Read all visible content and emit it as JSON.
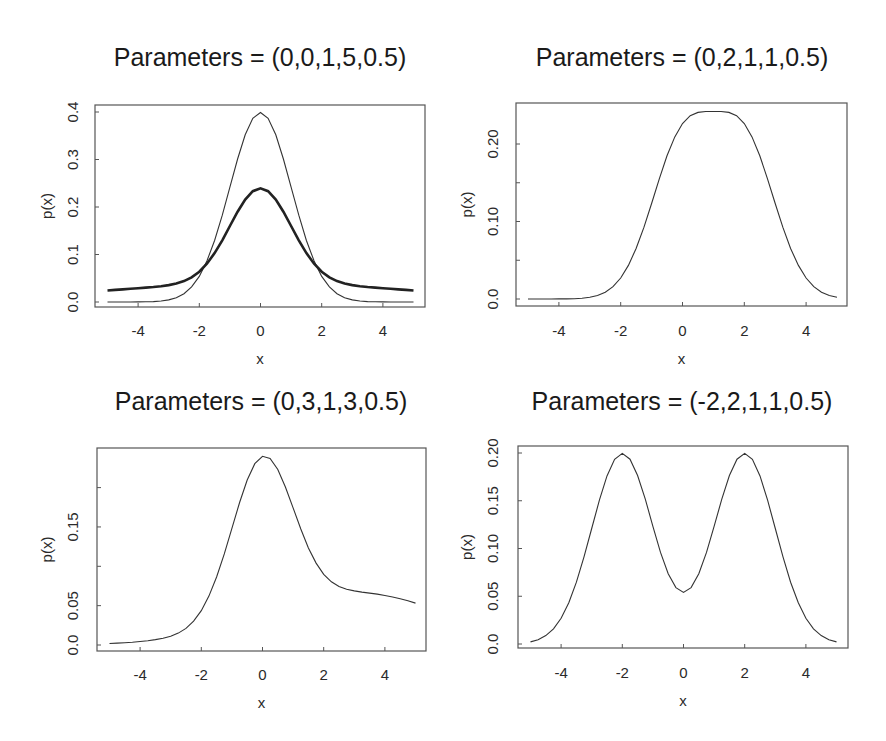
{
  "chart_data": [
    {
      "type": "line",
      "title": "Parameters = (0,0,1,5,0.5)",
      "xlabel": "x",
      "ylabel": "p(x)",
      "xlim": [
        -5,
        5
      ],
      "ylim": [
        0,
        0.4
      ],
      "x_ticks": [
        -4,
        -2,
        0,
        2,
        4
      ],
      "x_tick_labels": [
        "-4",
        "-2",
        "0",
        "2",
        "4"
      ],
      "y_ticks": [
        0.0,
        0.1,
        0.2,
        0.3,
        0.4
      ],
      "y_tick_labels": [
        "0.0",
        "0.1",
        "0.2",
        "0.3",
        "0.4"
      ],
      "grid": false,
      "legend": null,
      "frame": {
        "left": 95,
        "top": 105,
        "right": 425,
        "bottom": 307
      },
      "mapping": {
        "x0": 260.5,
        "xscale": 30.6,
        "y0": 302,
        "yscale": 475
      },
      "label_pos": {
        "title_x": 260,
        "title_y": 66,
        "xlabel_y": 364,
        "ylabel_x": 52,
        "ytick_x": 78,
        "xtick_y": 336
      },
      "x": [
        -5,
        -4.75,
        -4.5,
        -4.25,
        -4,
        -3.75,
        -3.5,
        -3.25,
        -3,
        -2.75,
        -2.5,
        -2.25,
        -2,
        -1.75,
        -1.5,
        -1.25,
        -1,
        -0.75,
        -0.5,
        -0.25,
        0,
        0.25,
        0.5,
        0.75,
        1,
        1.25,
        1.5,
        1.75,
        2,
        2.25,
        2.5,
        2.75,
        3,
        3.25,
        3.5,
        3.75,
        4,
        4.25,
        4.5,
        4.75,
        5
      ],
      "series": [
        {
          "name": "thin",
          "style": "thin",
          "values": [
            0.0,
            1e-05,
            2e-05,
            5e-05,
            0.00013,
            0.00035,
            0.00087,
            0.00203,
            0.00443,
            0.00909,
            0.01753,
            0.03174,
            0.05399,
            0.08628,
            0.12952,
            0.18265,
            0.24197,
            0.30114,
            0.35207,
            0.38667,
            0.39894,
            0.38667,
            0.35207,
            0.30114,
            0.24197,
            0.18265,
            0.12952,
            0.08628,
            0.05399,
            0.03174,
            0.01753,
            0.00909,
            0.00443,
            0.00203,
            0.00087,
            0.00035,
            0.00013,
            5e-05,
            2e-05,
            1e-05,
            0.0
          ]
        },
        {
          "name": "thick",
          "style": "thick",
          "values": [
            0.0242,
            0.02541,
            0.02662,
            0.02783,
            0.02904,
            0.03029,
            0.03166,
            0.03332,
            0.03554,
            0.03884,
            0.04398,
            0.05193,
            0.06383,
            0.08067,
            0.1029,
            0.13,
            0.16009,
            0.19002,
            0.21573,
            0.23318,
            0.23937,
            0.23318,
            0.21573,
            0.19002,
            0.16009,
            0.13,
            0.1029,
            0.08067,
            0.06383,
            0.05193,
            0.04398,
            0.03884,
            0.03554,
            0.03332,
            0.03166,
            0.03029,
            0.02904,
            0.02783,
            0.02662,
            0.02541,
            0.0242
          ]
        }
      ]
    },
    {
      "type": "line",
      "title": "Parameters = (0,2,1,1,0.5)",
      "xlabel": "x",
      "ylabel": "p(x)",
      "xlim": [
        -5,
        5
      ],
      "ylim": [
        0,
        0.25
      ],
      "x_ticks": [
        -4,
        -2,
        0,
        2,
        4
      ],
      "x_tick_labels": [
        "-4",
        "-2",
        "0",
        "2",
        "4"
      ],
      "y_ticks": [
        0.0,
        0.1,
        0.2
      ],
      "y_tick_labels": [
        "0.0",
        "0.10",
        "0.20"
      ],
      "y_minor_ticks": [
        0.05,
        0.15
      ],
      "grid": false,
      "legend": null,
      "frame": {
        "left": 516,
        "top": 103,
        "right": 847,
        "bottom": 306
      },
      "mapping": {
        "x0": 682.5,
        "xscale": 30.9,
        "y0": 299,
        "yscale": 775
      },
      "label_pos": {
        "title_x": 682,
        "title_y": 66,
        "xlabel_y": 364,
        "ylabel_x": 472,
        "ytick_x": 498,
        "xtick_y": 336
      },
      "x": [
        -5,
        -4.75,
        -4.5,
        -4.25,
        -4,
        -3.75,
        -3.5,
        -3.25,
        -3,
        -2.75,
        -2.5,
        -2.25,
        -2,
        -1.75,
        -1.5,
        -1.25,
        -1,
        -0.75,
        -0.5,
        -0.25,
        0,
        0.25,
        0.5,
        0.75,
        1,
        1.25,
        1.5,
        1.75,
        2,
        2.25,
        2.5,
        2.75,
        3,
        3.25,
        3.5,
        3.75,
        4,
        4.25,
        4.5,
        4.75,
        5
      ],
      "series": [
        {
          "name": "density",
          "style": "thin",
          "values": [
            0.0,
            0.0,
            1e-05,
            3e-05,
            7e-05,
            0.00018,
            0.00044,
            0.00102,
            0.00222,
            0.00455,
            0.00878,
            0.0159,
            0.02707,
            0.04331,
            0.0652,
            0.09235,
            0.12321,
            0.15512,
            0.18481,
            0.20921,
            0.22647,
            0.23648,
            0.2408,
            0.2419,
            0.24197,
            0.2419,
            0.2408,
            0.23648,
            0.22647,
            0.20921,
            0.18481,
            0.15512,
            0.12321,
            0.09235,
            0.0652,
            0.04331,
            0.02707,
            0.0159,
            0.00878,
            0.00455,
            0.00222
          ]
        }
      ]
    },
    {
      "type": "line",
      "title": "Parameters = (0,3,1,3,0.5)",
      "xlabel": "x",
      "ylabel": "p(x)",
      "xlim": [
        -5,
        5
      ],
      "ylim": [
        0,
        0.24
      ],
      "x_ticks": [
        -4,
        -2,
        0,
        2,
        4
      ],
      "x_tick_labels": [
        "-4",
        "-2",
        "0",
        "2",
        "4"
      ],
      "y_ticks": [
        0.0,
        0.05,
        0.15
      ],
      "y_tick_labels": [
        "0.0",
        "0.05",
        "0.15"
      ],
      "y_minor_ticks": [
        0.1,
        0.2
      ],
      "grid": false,
      "legend": null,
      "frame": {
        "left": 97,
        "top": 448,
        "right": 426,
        "bottom": 651
      },
      "mapping": {
        "x0": 262.5,
        "xscale": 30.6,
        "y0": 645,
        "yscale": 787
      },
      "label_pos": {
        "title_x": 261,
        "title_y": 410,
        "xlabel_y": 708,
        "ylabel_x": 52,
        "ytick_x": 78,
        "xtick_y": 680
      },
      "x": [
        -5,
        -4.75,
        -4.5,
        -4.25,
        -4,
        -3.75,
        -3.5,
        -3.25,
        -3,
        -2.75,
        -2.5,
        -2.25,
        -2,
        -1.75,
        -1.5,
        -1.25,
        -1,
        -0.75,
        -0.5,
        -0.25,
        0,
        0.25,
        0.5,
        0.75,
        1,
        1.25,
        1.5,
        1.75,
        2,
        2.25,
        2.5,
        2.75,
        3,
        3.25,
        3.5,
        3.75,
        4,
        4.25,
        4.5,
        4.75,
        5
      ],
      "series": [
        {
          "name": "density",
          "style": "thin",
          "values": [
            0.0019,
            0.00237,
            0.00293,
            0.00361,
            0.00444,
            0.00547,
            0.0068,
            0.00861,
            0.01122,
            0.01514,
            0.02115,
            0.03025,
            0.04358,
            0.06213,
            0.08635,
            0.11571,
            0.14832,
            0.18102,
            0.2097,
            0.23032,
            0.2398,
            0.23702,
            0.22302,
            0.20076,
            0.17423,
            0.14742,
            0.12344,
            0.1041,
            0.08989,
            0.08032,
            0.07434,
            0.07081,
            0.06871,
            0.06728,
            0.06601,
            0.06462,
            0.06296,
            0.06098,
            0.05869,
            0.0561,
            0.05324
          ]
        }
      ]
    },
    {
      "type": "line",
      "title": "Parameters = (-2,2,1,1,0.5)",
      "xlabel": "x",
      "ylabel": "p(x)",
      "xlim": [
        -5,
        5
      ],
      "ylim": [
        0,
        0.2
      ],
      "x_ticks": [
        -4,
        -2,
        0,
        2,
        4
      ],
      "x_tick_labels": [
        "-4",
        "-2",
        "0",
        "2",
        "4"
      ],
      "y_ticks": [
        0.0,
        0.05,
        0.1,
        0.15,
        0.2
      ],
      "y_tick_labels": [
        "0.0",
        "0.05",
        "0.10",
        "0.15",
        "0.20"
      ],
      "grid": false,
      "legend": null,
      "frame": {
        "left": 518,
        "top": 446,
        "right": 848,
        "bottom": 648
      },
      "mapping": {
        "x0": 683.5,
        "xscale": 30.6,
        "y0": 644,
        "yscale": 955
      },
      "label_pos": {
        "title_x": 682,
        "title_y": 410,
        "xlabel_y": 706,
        "ylabel_x": 472,
        "ytick_x": 498,
        "xtick_y": 678
      },
      "x": [
        -5,
        -4.75,
        -4.5,
        -4.25,
        -4,
        -3.75,
        -3.5,
        -3.25,
        -3,
        -2.75,
        -2.5,
        -2.25,
        -2,
        -1.75,
        -1.5,
        -1.25,
        -1,
        -0.75,
        -0.5,
        -0.25,
        0,
        0.25,
        0.5,
        0.75,
        1,
        1.25,
        1.5,
        1.75,
        2,
        2.25,
        2.5,
        2.75,
        3,
        3.25,
        3.5,
        3.75,
        4,
        4.25,
        4.5,
        4.75,
        5
      ],
      "series": [
        {
          "name": "density",
          "style": "thin",
          "values": [
            0.00222,
            0.00455,
            0.00877,
            0.01587,
            0.027,
            0.04314,
            0.06476,
            0.09133,
            0.12099,
            0.15057,
            0.17604,
            0.19336,
            0.19954,
            0.19351,
            0.17647,
            0.15159,
            0.1232,
            0.09587,
            0.07353,
            0.05901,
            0.05399,
            0.05901,
            0.07353,
            0.09587,
            0.1232,
            0.15159,
            0.17647,
            0.19351,
            0.19954,
            0.19336,
            0.17604,
            0.15057,
            0.12099,
            0.09133,
            0.06476,
            0.04314,
            0.027,
            0.01587,
            0.00877,
            0.00455,
            0.00222
          ]
        }
      ]
    }
  ]
}
